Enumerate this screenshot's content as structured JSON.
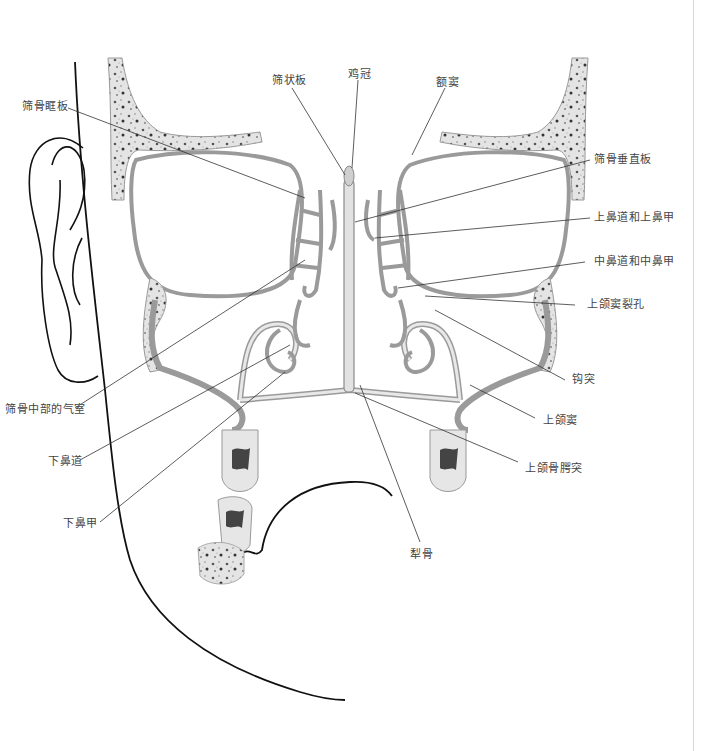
{
  "diagram": {
    "title": "",
    "labels": {
      "cribriform_plate": "筛状板",
      "crista_galli": "鸡冠",
      "frontal_sinus": "额窦",
      "orbital_plate_ethmoid": "筛骨眶板",
      "perpendicular_plate_ethmoid": "筛骨垂直板",
      "superior_meatus_concha": "上鼻道和上鼻甲",
      "middle_meatus_concha": "中鼻道和中鼻甲",
      "maxillary_hiatus": "上颌窦裂孔",
      "uncinate_process": "钩突",
      "maxillary_sinus": "上颌窦",
      "alveolar_process": "上颌骨腭突",
      "ethmoid_air_cells": "筛骨中部的气室",
      "inferior_meatus": "下鼻道",
      "inferior_concha": "下鼻甲",
      "vomer": "犁骨"
    },
    "colors": {
      "bone_fill": "#e6e6e6",
      "bone_edge": "#9a9a9a",
      "outline": "#111111",
      "leader_line": "#333333",
      "label_text": "#444444"
    }
  }
}
